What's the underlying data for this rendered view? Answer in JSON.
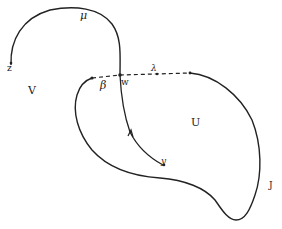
{
  "diagram": {
    "type": "topology-curves",
    "colors": {
      "stroke": "#222222",
      "background": "#ffffff"
    },
    "regions": [
      {
        "id": "V",
        "label": "V"
      },
      {
        "id": "U",
        "label": "U"
      }
    ],
    "curves": [
      {
        "id": "mu",
        "label": "μ",
        "style": "solid"
      },
      {
        "id": "lambda",
        "label": "λ",
        "style": "dashed"
      },
      {
        "id": "beta",
        "label": "β",
        "style": "solid"
      },
      {
        "id": "J",
        "label": "J",
        "style": "solid"
      },
      {
        "id": "path-to-y",
        "label": "",
        "style": "solid-with-arrow"
      }
    ],
    "points": [
      {
        "id": "z",
        "label": "z"
      },
      {
        "id": "w",
        "label": "w"
      },
      {
        "id": "y",
        "label": "y"
      }
    ]
  }
}
